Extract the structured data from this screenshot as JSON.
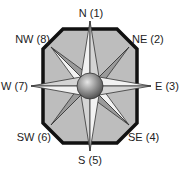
{
  "diagram": {
    "type": "compass-rose",
    "labels": {
      "n": "N (1)",
      "ne": "NE (2)",
      "e": "E (3)",
      "se": "SE (4)",
      "s": "S (5)",
      "sw": "SW (6)",
      "w": "W (7)",
      "nw": "NW (8)"
    },
    "colors": {
      "frame_border": "#111111",
      "frame_fill": "#bdbdbd",
      "point_light": "#f2f2f2",
      "point_shade": "#9a9a9a",
      "outline": "#333333",
      "sphere_light": "#d8d8d8",
      "sphere_dark": "#555555"
    }
  }
}
